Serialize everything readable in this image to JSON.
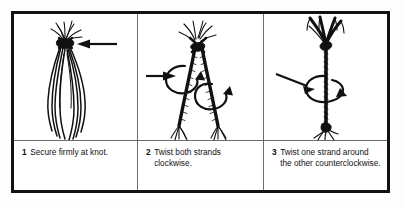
{
  "figure": {
    "background_color": "#ffffff",
    "border_color": "#121212",
    "divider_color": "#6d6d6d",
    "ink_color": "#111111"
  },
  "panels": [
    {
      "number": "1",
      "text": "Secure firmly at knot.",
      "illustration": "two-strand-bundle-hanging-from-knot-with-pointer-arrow",
      "arrows": [
        {
          "kind": "straight-arrow",
          "direction": "left",
          "target": "knot"
        }
      ]
    },
    {
      "number": "2",
      "text": "Twist both strands clockwise.",
      "illustration": "two-separated-twisted-strands-in-inverted-v-with-two-rotation-loops",
      "arrows": [
        {
          "kind": "straight-arrow",
          "direction": "right",
          "target": "left-strand"
        },
        {
          "kind": "rotation-loop",
          "direction": "clockwise",
          "target": "left-strand"
        },
        {
          "kind": "rotation-loop",
          "direction": "clockwise",
          "target": "right-strand"
        }
      ]
    },
    {
      "number": "3",
      "text": "Twist one strand around the other counterclockwise.",
      "illustration": "single-plied-cord-with-counterclockwise-rotation-loop",
      "arrows": [
        {
          "kind": "straight-arrow",
          "direction": "down-right",
          "target": "cord"
        },
        {
          "kind": "rotation-loop",
          "direction": "counterclockwise",
          "target": "cord"
        }
      ]
    }
  ]
}
